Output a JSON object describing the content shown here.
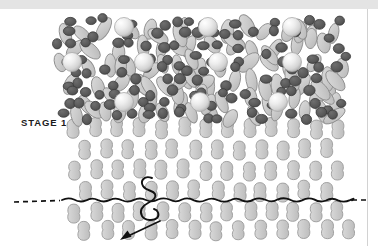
{
  "figure": {
    "stage_label": "STAGE 14",
    "type": "lipid-bilayer-membrane-diagram",
    "colors": {
      "page_background": "#ffffff",
      "top_band": "#e4e4e4",
      "right_rule": "#d2d2d2",
      "head_group_dark": "#595959",
      "head_group_dark_stroke": "#3c3c3c",
      "tail_light": "#c9c9c9",
      "tail_light_stroke": "#8e8e8e",
      "ordered_lipid_fill": "#cccccc",
      "ordered_lipid_stroke": "#9a9a9a",
      "sphere_highlight": "#fdfdfd",
      "sphere_mid": "#dedede",
      "sphere_edge": "#a9a9a9",
      "line_black": "#111111",
      "label_text": "#1b1b1b"
    },
    "canvas": {
      "width": 378,
      "height": 246
    },
    "membrane": {
      "left": 62,
      "right": 345,
      "disordered_top": 16,
      "transition_y": 118,
      "ordered_bottom": 241
    },
    "large_spheres": {
      "radius": 9.5,
      "rows": [
        {
          "y": 27,
          "cx": [
            124,
            208,
            292
          ]
        },
        {
          "y": 62,
          "cx": [
            72,
            144,
            218,
            292
          ]
        },
        {
          "y": 102,
          "cx": [
            124,
            200,
            278
          ]
        }
      ]
    },
    "dark_heads": {
      "radius_x": 5.2,
      "radius_y": 4.6,
      "count_approx": 140
    },
    "ordered_leaflet": {
      "rows_y": [
        128,
        149,
        170,
        191,
        212,
        230
      ],
      "columns_x": [
        74,
        96,
        118,
        140,
        162,
        184,
        206,
        228,
        250,
        272,
        294,
        316,
        338
      ],
      "lipid_width": 13,
      "lipid_height": 19
    },
    "wavy_line": {
      "y": 200,
      "x_start": 62,
      "x_end": 352,
      "dash_left_from": 14,
      "dash_left_to": 60,
      "dash_right_from": 352,
      "dash_right_to": 366,
      "amplitude": 3
    },
    "thread_loop": {
      "description": "black looping thread crossing the bilayer near x=150",
      "arrow_tip": {
        "x": 120,
        "y": 240
      },
      "arrow_tail": {
        "x": 160,
        "y": 221
      }
    }
  }
}
